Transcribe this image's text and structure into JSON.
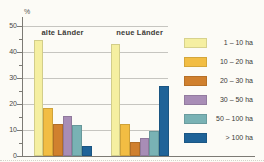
{
  "chart_data": {
    "type": "bar",
    "unit_label": "%",
    "categories": [
      "1 – 10 ha",
      "10 – 20 ha",
      "20 – 30 ha",
      "30 – 50 ha",
      "50 – 100 ha",
      "> 100 ha"
    ],
    "groups": [
      {
        "label": "alte Länder",
        "values": [
          44.5,
          18.5,
          12.5,
          15.5,
          12,
          4
        ]
      },
      {
        "label": "neue Länder",
        "values": [
          43,
          12.5,
          5.5,
          7,
          9.5,
          27
        ]
      }
    ],
    "legend": [
      {
        "label": "1 –  10 ha",
        "color": "#F5EFA1"
      },
      {
        "label": "10 –  20 ha",
        "color": "#F2BD43"
      },
      {
        "label": "20 –  30 ha",
        "color": "#D0802E"
      },
      {
        "label": "30 –  50 ha",
        "color": "#A88DB6"
      },
      {
        "label": "50 – 100 ha",
        "color": "#79B2B4"
      },
      {
        "label": "> 100 ha",
        "color": "#1F6398"
      }
    ],
    "y_axis": {
      "min": 0,
      "max": 50,
      "major_step": 10,
      "minor_step": 5,
      "unit": "%"
    },
    "legend_position": "right",
    "grid": true
  }
}
